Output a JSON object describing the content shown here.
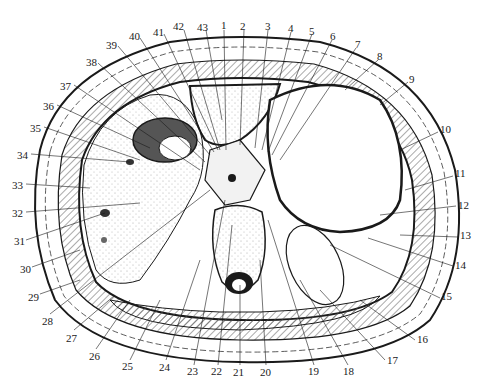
{
  "figure": {
    "type": "anatomical cross-section",
    "colors": {
      "ink": "#1a1a1a",
      "background": "#ffffff",
      "stipple": "#9a9a9a",
      "hatch": "#555555"
    },
    "labels": [
      {
        "n": "1",
        "x": 221,
        "y": 20
      },
      {
        "n": "2",
        "x": 240,
        "y": 21
      },
      {
        "n": "3",
        "x": 265,
        "y": 21
      },
      {
        "n": "4",
        "x": 288,
        "y": 23
      },
      {
        "n": "5",
        "x": 309,
        "y": 26
      },
      {
        "n": "6",
        "x": 330,
        "y": 31
      },
      {
        "n": "7",
        "x": 355,
        "y": 39
      },
      {
        "n": "8",
        "x": 377,
        "y": 51
      },
      {
        "n": "9",
        "x": 409,
        "y": 74
      },
      {
        "n": "10",
        "x": 440,
        "y": 129
      },
      {
        "n": "11",
        "x": 455,
        "y": 172
      },
      {
        "n": "12",
        "x": 458,
        "y": 203
      },
      {
        "n": "13",
        "x": 460,
        "y": 233
      },
      {
        "n": "14",
        "x": 455,
        "y": 263
      },
      {
        "n": "15",
        "x": 441,
        "y": 295
      },
      {
        "n": "16",
        "x": 417,
        "y": 336
      },
      {
        "n": "17",
        "x": 387,
        "y": 357
      },
      {
        "n": "18",
        "x": 347,
        "y": 366
      },
      {
        "n": "19",
        "x": 312,
        "y": 366
      },
      {
        "n": "20",
        "x": 263,
        "y": 367
      },
      {
        "n": "21",
        "x": 236,
        "y": 367
      },
      {
        "n": "22",
        "x": 214,
        "y": 366
      },
      {
        "n": "23",
        "x": 190,
        "y": 366
      },
      {
        "n": "24",
        "x": 162,
        "y": 362
      },
      {
        "n": "25",
        "x": 125,
        "y": 361
      },
      {
        "n": "26",
        "x": 92,
        "y": 351
      },
      {
        "n": "27",
        "x": 69,
        "y": 332
      },
      {
        "n": "28",
        "x": 45,
        "y": 316
      },
      {
        "n": "29",
        "x": 30,
        "y": 292
      },
      {
        "n": "30",
        "x": 22,
        "y": 264
      },
      {
        "n": "31",
        "x": 16,
        "y": 236
      },
      {
        "n": "32",
        "x": 14,
        "y": 208
      },
      {
        "n": "33",
        "x": 14,
        "y": 180
      },
      {
        "n": "34",
        "x": 19,
        "y": 150
      },
      {
        "n": "35",
        "x": 32,
        "y": 123
      },
      {
        "n": "36",
        "x": 45,
        "y": 101
      },
      {
        "n": "37",
        "x": 62,
        "y": 81
      },
      {
        "n": "38",
        "x": 87,
        "y": 57
      },
      {
        "n": "39",
        "x": 108,
        "y": 40
      },
      {
        "n": "40",
        "x": 131,
        "y": 31
      },
      {
        "n": "41",
        "x": 156,
        "y": 27
      },
      {
        "n": "42",
        "x": 175,
        "y": 21
      },
      {
        "n": "43",
        "x": 200,
        "y": 22
      }
    ]
  }
}
